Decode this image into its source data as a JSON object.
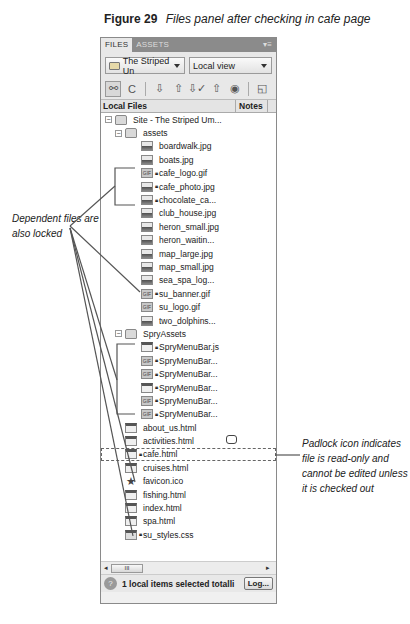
{
  "caption": {
    "figure_label": "Figure 29",
    "description": "Files panel after checking in cafe page"
  },
  "panel": {
    "tabs": [
      {
        "label": "FILES",
        "active": true
      },
      {
        "label": "ASSETS",
        "active": false
      }
    ],
    "tab_menu_icon": "panel-menu-icon",
    "site_select": {
      "value": "The Striped Un",
      "icon": "folder-icon"
    },
    "view_select": {
      "value": "Local view"
    },
    "toolbar": [
      {
        "name": "connect-icon",
        "glyph": "⚯",
        "pressed": true
      },
      {
        "name": "refresh-icon",
        "glyph": "C"
      },
      {
        "separator": true
      },
      {
        "name": "get-files-icon",
        "glyph": "⇩"
      },
      {
        "name": "put-files-icon",
        "glyph": "⇧"
      },
      {
        "name": "check-out-icon",
        "glyph": "⇩✓"
      },
      {
        "name": "check-in-icon",
        "glyph": "⇧"
      },
      {
        "name": "synchronize-icon",
        "glyph": "◉"
      },
      {
        "separator": true
      },
      {
        "name": "expand-icon",
        "glyph": "◱"
      }
    ],
    "columns": {
      "local_files": "Local Files",
      "notes": "Notes"
    },
    "tree": [
      {
        "level": 0,
        "type": "folder",
        "toggle": "−",
        "label": "Site - The Striped Um..."
      },
      {
        "level": 1,
        "type": "folder",
        "toggle": "−",
        "label": "assets"
      },
      {
        "level": 2,
        "type": "img",
        "label": "boardwalk.jpg"
      },
      {
        "level": 2,
        "type": "img",
        "label": "boats.jpg"
      },
      {
        "level": 2,
        "type": "gif",
        "locked": true,
        "label": "cafe_logo.gif"
      },
      {
        "level": 2,
        "type": "img",
        "locked": true,
        "label": "cafe_photo.jpg"
      },
      {
        "level": 2,
        "type": "img",
        "locked": true,
        "label": "chocolate_ca..."
      },
      {
        "level": 2,
        "type": "img",
        "label": "club_house.jpg"
      },
      {
        "level": 2,
        "type": "img",
        "label": "heron_small.jpg"
      },
      {
        "level": 2,
        "type": "img",
        "label": "heron_waitin..."
      },
      {
        "level": 2,
        "type": "img",
        "label": "map_large.jpg"
      },
      {
        "level": 2,
        "type": "img",
        "label": "map_small.jpg"
      },
      {
        "level": 2,
        "type": "img",
        "label": "sea_spa_log..."
      },
      {
        "level": 2,
        "type": "gif",
        "locked": true,
        "label": "su_banner.gif"
      },
      {
        "level": 2,
        "type": "gif",
        "label": "su_logo.gif"
      },
      {
        "level": 2,
        "type": "img",
        "label": "two_dolphins..."
      },
      {
        "level": 1,
        "type": "folder",
        "toggle": "−",
        "label": "SpryAssets"
      },
      {
        "level": 2,
        "type": "js",
        "locked": true,
        "label": "SpryMenuBar.js"
      },
      {
        "level": 2,
        "type": "gif",
        "locked": true,
        "label": "SpryMenuBar..."
      },
      {
        "level": 2,
        "type": "gif",
        "locked": true,
        "label": "SpryMenuBar..."
      },
      {
        "level": 2,
        "type": "js",
        "locked": true,
        "label": "SpryMenuBar..."
      },
      {
        "level": 2,
        "type": "gif",
        "locked": true,
        "label": "SpryMenuBar..."
      },
      {
        "level": 2,
        "type": "gif",
        "locked": true,
        "label": "SpryMenuBar..."
      },
      {
        "level": 1,
        "type": "html",
        "label": "about_us.html"
      },
      {
        "level": 1,
        "type": "html",
        "label": "activities.html",
        "note": true
      },
      {
        "level": 1,
        "type": "html",
        "locked": true,
        "selected": true,
        "label": "cafe.html"
      },
      {
        "level": 1,
        "type": "html",
        "label": "cruises.html"
      },
      {
        "level": 1,
        "type": "star",
        "label": "favicon.ico"
      },
      {
        "level": 1,
        "type": "html",
        "label": "fishing.html"
      },
      {
        "level": 1,
        "type": "html",
        "label": "index.html"
      },
      {
        "level": 1,
        "type": "html",
        "label": "spa.html"
      },
      {
        "level": 1,
        "type": "css",
        "locked": true,
        "label": "su_styles.css"
      }
    ],
    "hscroll": {
      "left_arrow": "◂",
      "thumb": "III",
      "right_arrow": "▸"
    },
    "status": {
      "help_icon": "?",
      "text": "1 local items selected totalli",
      "log_button": "Log..."
    }
  },
  "callouts": {
    "left": "Dependent files are also locked",
    "right": "Padlock icon indicates file is read-only and cannot be edited unless it is checked out"
  },
  "colors": {
    "tab_bar": "#8b8b8b",
    "panel_bg": "#e8e8e8",
    "tree_bg": "#ffffff",
    "line": "#555555"
  }
}
